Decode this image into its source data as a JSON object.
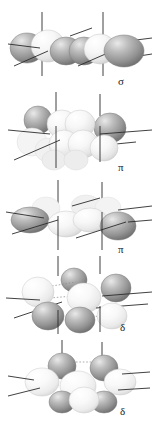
{
  "figure": {
    "background_color": "#ffffff",
    "width": 158,
    "height": 424,
    "label_color": "#1a1a1a",
    "axis_color": "#2b2b2b",
    "lobe_dark_color": "#8f8f8f",
    "lobe_light_color": "#f2f2f2",
    "lobe_outline_color": "#6e6e6e"
  },
  "panels": [
    {
      "id": "panel-sigma",
      "label": "σ",
      "symmetry_name": "sigma-orbital",
      "description": "d z2 - d z2 sigma overlap, lobes aligned along the internuclear axis",
      "top": 4,
      "height": 88,
      "label_x": 118,
      "label_y": 76,
      "lobe_count": 6,
      "axis_count": 3
    },
    {
      "id": "panel-pi-1",
      "label": "π",
      "symmetry_name": "pi-orbital-vertical",
      "description": "d xz - d xz pi overlap, lobes above and below the internuclear axis",
      "top": 90,
      "height": 88,
      "label_x": 118,
      "label_y": 163,
      "lobe_count": 8,
      "axis_count": 3
    },
    {
      "id": "panel-pi-2",
      "label": "π",
      "symmetry_name": "pi-orbital-horizontal",
      "description": "d yz - d yz pi overlap, lobes in the horizontal plane",
      "top": 176,
      "height": 84,
      "label_x": 118,
      "label_y": 245,
      "lobe_count": 8,
      "axis_count": 3
    },
    {
      "id": "panel-delta-1",
      "label": "δ",
      "symmetry_name": "delta-orbital-1",
      "description": "d xy - d xy delta overlap, eight lobes in clover arrangement",
      "top": 254,
      "height": 86,
      "label_x": 120,
      "label_y": 325,
      "lobe_count": 8,
      "axis_count": 3
    },
    {
      "id": "panel-delta-2",
      "label": "δ",
      "symmetry_name": "delta-orbital-2",
      "description": "d x2-y2 - d x2-y2 delta overlap, eight lobes with nodal planes",
      "top": 338,
      "height": 86,
      "label_x": 120,
      "label_y": 406,
      "lobe_count": 8,
      "axis_count": 3
    }
  ]
}
